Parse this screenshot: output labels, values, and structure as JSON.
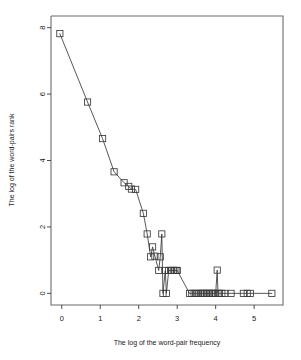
{
  "chart_data": {
    "type": "line",
    "title": "",
    "subtitle": "",
    "xlabel": "The log of the word-pair frequency",
    "ylabel": "The log of the word-pairs rank",
    "xlim": [
      -0.28,
      5.75
    ],
    "ylim": [
      -0.35,
      8.35
    ],
    "xticks": [
      0,
      1,
      2,
      3,
      4,
      5
    ],
    "xtick_labels": [
      "0",
      "1",
      "2",
      "3",
      "4",
      "5"
    ],
    "yticks": [
      0,
      2,
      4,
      6,
      8
    ],
    "ytick_labels": [
      "0",
      "2",
      "4",
      "6",
      "8"
    ],
    "grid": false,
    "legend": null,
    "marker": "open-square",
    "line_color": "#3a3a3a",
    "marker_color": "#3a3a3a",
    "series": [
      {
        "name": "word-pairs",
        "x": [
          -0.05,
          0.67,
          1.06,
          1.36,
          1.62,
          1.74,
          1.81,
          1.92,
          2.12,
          2.22,
          2.31,
          2.36,
          2.42,
          2.52,
          2.56,
          2.6,
          2.63,
          2.69,
          2.72,
          2.78,
          2.83,
          2.86,
          2.9,
          2.94,
          2.99,
          3.0,
          3.32,
          3.38,
          3.44,
          3.5,
          3.55,
          3.6,
          3.64,
          3.68,
          3.72,
          3.76,
          3.8,
          3.84,
          3.88,
          3.92,
          3.96,
          4.0,
          4.04,
          4.06,
          4.1,
          4.16,
          4.24,
          4.4,
          4.72,
          4.82,
          4.9,
          5.46
        ],
        "y": [
          7.82,
          5.76,
          4.66,
          3.66,
          3.33,
          3.22,
          3.14,
          3.13,
          2.41,
          1.79,
          1.1,
          1.4,
          1.12,
          0.69,
          1.1,
          1.79,
          0.0,
          0.69,
          0.0,
          0.69,
          0.69,
          0.69,
          0.69,
          0.69,
          0.69,
          0.69,
          0.0,
          0.0,
          0.0,
          0.0,
          0.0,
          0.0,
          0.0,
          0.0,
          0.0,
          0.0,
          0.0,
          0.0,
          0.0,
          0.0,
          0.0,
          0.0,
          0.7,
          0.0,
          0.0,
          0.0,
          0.0,
          0.0,
          0.0,
          0.0,
          0.0,
          0.0
        ]
      }
    ]
  }
}
